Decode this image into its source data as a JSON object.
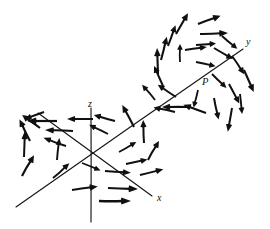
{
  "figure": {
    "caption": "",
    "background_color": "#ffffff",
    "ink_color": "#101010",
    "width": 270,
    "height": 229
  },
  "labels": {
    "x_axis": "x",
    "y_axis": "y",
    "z_axis": "z",
    "point_p": "P"
  },
  "chart_data": {
    "type": "scatter",
    "title": "",
    "subtitle": "",
    "xlabel": "x",
    "ylabel": "y",
    "zlabel": "z",
    "grid": false,
    "legend_position": "none",
    "annotations": [
      {
        "text": "y",
        "x": 246,
        "y": 45,
        "style": "italic"
      },
      {
        "text": "P",
        "x": 202,
        "y": 85,
        "style": "italic"
      },
      {
        "text": "z",
        "x": 88,
        "y": 107,
        "style": "italic"
      },
      {
        "text": "x",
        "x": 157,
        "y": 201,
        "style": "italic"
      }
    ],
    "axes": [
      {
        "name": "z",
        "x1": 91,
        "y1": 108,
        "x2": 91,
        "y2": 222
      },
      {
        "name": "x",
        "x1": 38,
        "y1": 113,
        "x2": 152,
        "y2": 196
      },
      {
        "name": "y",
        "x1": 16,
        "y1": 207,
        "x2": 243,
        "y2": 49
      }
    ],
    "vortices": [
      {
        "name": "vortex-left",
        "center_x": 88,
        "center_y": 157,
        "radius_x": 62,
        "radius_y": 44,
        "sense": "clockwise",
        "arrow_count": 24
      },
      {
        "name": "vortex-right",
        "center_x": 198,
        "center_y": 68,
        "radius_x": 52,
        "radius_y": 56,
        "sense": "counterclockwise",
        "arrow_count": 26
      }
    ],
    "vectors_left": [
      {
        "x": 57,
        "y": 121,
        "angle": 180,
        "length": 30,
        "weight": 2.2
      },
      {
        "x": 93,
        "y": 119,
        "angle": 180,
        "length": 26,
        "weight": 2.0
      },
      {
        "x": 115,
        "y": 121,
        "angle": 196,
        "length": 22,
        "weight": 2.0
      },
      {
        "x": 40,
        "y": 128,
        "angle": 216,
        "length": 22,
        "weight": 2.2
      },
      {
        "x": 73,
        "y": 131,
        "angle": 182,
        "length": 28,
        "weight": 2.0
      },
      {
        "x": 108,
        "y": 134,
        "angle": 206,
        "length": 21,
        "weight": 1.9
      },
      {
        "x": 134,
        "y": 127,
        "angle": 242,
        "length": 25,
        "weight": 2.1
      },
      {
        "x": 30,
        "y": 141,
        "angle": 244,
        "length": 24,
        "weight": 2.1
      },
      {
        "x": 66,
        "y": 146,
        "angle": 200,
        "length": 24,
        "weight": 1.9
      },
      {
        "x": 144,
        "y": 143,
        "angle": 268,
        "length": 23,
        "weight": 2.0
      },
      {
        "x": 24,
        "y": 157,
        "angle": 272,
        "length": 26,
        "weight": 2.0
      },
      {
        "x": 57,
        "y": 160,
        "angle": 276,
        "length": 22,
        "weight": 1.9
      },
      {
        "x": 148,
        "y": 160,
        "angle": 300,
        "length": 22,
        "weight": 2.0
      },
      {
        "x": 22,
        "y": 176,
        "angle": 300,
        "length": 24,
        "weight": 2.2
      },
      {
        "x": 53,
        "y": 178,
        "angle": 318,
        "length": 22,
        "weight": 2.0
      },
      {
        "x": 105,
        "y": 171,
        "angle": 4,
        "length": 26,
        "weight": 2.0
      },
      {
        "x": 140,
        "y": 175,
        "angle": 346,
        "length": 24,
        "weight": 2.0
      },
      {
        "x": 72,
        "y": 190,
        "angle": 352,
        "length": 26,
        "weight": 2.1
      },
      {
        "x": 108,
        "y": 188,
        "angle": 2,
        "length": 30,
        "weight": 2.2
      },
      {
        "x": 99,
        "y": 201,
        "angle": 0,
        "length": 32,
        "weight": 2.3
      },
      {
        "x": 82,
        "y": 163,
        "angle": 22,
        "length": 20,
        "weight": 1.8
      },
      {
        "x": 119,
        "y": 152,
        "angle": 330,
        "length": 20,
        "weight": 1.8
      },
      {
        "x": 126,
        "y": 164,
        "angle": 348,
        "length": 22,
        "weight": 1.9
      },
      {
        "x": 44,
        "y": 112,
        "angle": 160,
        "length": 20,
        "weight": 1.9
      }
    ],
    "vectors_right": [
      {
        "x": 176,
        "y": 34,
        "angle": 300,
        "length": 24,
        "weight": 2.1
      },
      {
        "x": 198,
        "y": 24,
        "angle": 340,
        "length": 24,
        "weight": 2.2
      },
      {
        "x": 200,
        "y": 34,
        "angle": 358,
        "length": 28,
        "weight": 2.2
      },
      {
        "x": 168,
        "y": 46,
        "angle": 290,
        "length": 22,
        "weight": 2.0
      },
      {
        "x": 185,
        "y": 50,
        "angle": 352,
        "length": 22,
        "weight": 1.9
      },
      {
        "x": 214,
        "y": 48,
        "angle": 30,
        "length": 22,
        "weight": 2.0
      },
      {
        "x": 161,
        "y": 60,
        "angle": 284,
        "length": 24,
        "weight": 2.1
      },
      {
        "x": 180,
        "y": 62,
        "angle": 270,
        "length": 18,
        "weight": 1.8
      },
      {
        "x": 232,
        "y": 56,
        "angle": 56,
        "length": 22,
        "weight": 2.0
      },
      {
        "x": 158,
        "y": 74,
        "angle": 268,
        "length": 26,
        "weight": 2.1
      },
      {
        "x": 196,
        "y": 62,
        "angle": 12,
        "length": 20,
        "weight": 1.9
      },
      {
        "x": 244,
        "y": 70,
        "angle": 66,
        "length": 24,
        "weight": 2.1
      },
      {
        "x": 163,
        "y": 86,
        "angle": 246,
        "length": 22,
        "weight": 2.0
      },
      {
        "x": 212,
        "y": 74,
        "angle": 44,
        "length": 20,
        "weight": 1.9
      },
      {
        "x": 229,
        "y": 84,
        "angle": 62,
        "length": 22,
        "weight": 2.0
      },
      {
        "x": 176,
        "y": 97,
        "angle": 214,
        "length": 22,
        "weight": 2.0
      },
      {
        "x": 198,
        "y": 90,
        "angle": 104,
        "length": 18,
        "weight": 1.8
      },
      {
        "x": 214,
        "y": 98,
        "angle": 78,
        "length": 22,
        "weight": 2.0
      },
      {
        "x": 188,
        "y": 107,
        "angle": 180,
        "length": 26,
        "weight": 2.1
      },
      {
        "x": 206,
        "y": 113,
        "angle": 200,
        "length": 24,
        "weight": 2.1
      },
      {
        "x": 232,
        "y": 108,
        "angle": 100,
        "length": 24,
        "weight": 2.0
      },
      {
        "x": 196,
        "y": 45,
        "angle": 356,
        "length": 20,
        "weight": 1.9
      },
      {
        "x": 175,
        "y": 112,
        "angle": 192,
        "length": 22,
        "weight": 2.0
      },
      {
        "x": 222,
        "y": 36,
        "angle": 40,
        "length": 20,
        "weight": 1.9
      },
      {
        "x": 155,
        "y": 100,
        "angle": 230,
        "length": 20,
        "weight": 1.9
      },
      {
        "x": 240,
        "y": 94,
        "angle": 84,
        "length": 20,
        "weight": 1.9
      }
    ]
  }
}
